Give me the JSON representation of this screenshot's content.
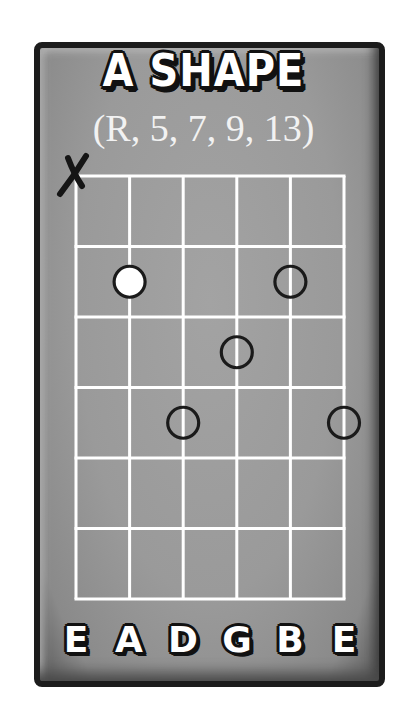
{
  "title": "A SHAPE",
  "subtitle": "(R, 5, 7, 9, 13)",
  "colors": {
    "card_fill": "#9a9a9a",
    "card_border": "#1c1c1c",
    "grid_lines": "#ffffff",
    "root_dot": "#ffffff",
    "note_outline": "#1a1a1a"
  },
  "fretboard": {
    "strings": 6,
    "frets": 6,
    "string_labels": [
      "E",
      "A",
      "D",
      "G",
      "B",
      "E"
    ],
    "muted_strings": [
      {
        "string": 1,
        "symbol": "X"
      }
    ],
    "notes": [
      {
        "string": 2,
        "fret": 2,
        "type": "root",
        "degree": "R"
      },
      {
        "string": 5,
        "fret": 2,
        "type": "interval"
      },
      {
        "string": 4,
        "fret": 3,
        "type": "interval"
      },
      {
        "string": 3,
        "fret": 4,
        "type": "interval"
      },
      {
        "string": 6,
        "fret": 4,
        "type": "interval"
      }
    ]
  }
}
